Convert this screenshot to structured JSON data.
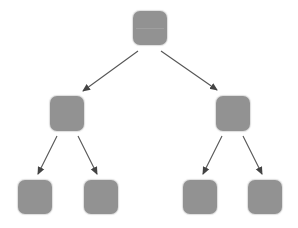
{
  "diagram": {
    "type": "tree",
    "colors": {
      "node_fill": "#929292",
      "edge": "#555555",
      "background": "#ffffff",
      "divider": "#b8b8b8"
    },
    "nodes": [
      {
        "id": "root",
        "level": 0,
        "x": 133,
        "y": 11,
        "w": 34,
        "h": 34,
        "divider": true
      },
      {
        "id": "mid-left",
        "level": 1,
        "x": 50,
        "y": 96,
        "w": 34,
        "h": 35,
        "divider": false
      },
      {
        "id": "mid-right",
        "level": 1,
        "x": 216,
        "y": 96,
        "w": 34,
        "h": 35,
        "divider": false
      },
      {
        "id": "leaf-1",
        "level": 2,
        "x": 18,
        "y": 180,
        "w": 34,
        "h": 34,
        "divider": false
      },
      {
        "id": "leaf-2",
        "level": 2,
        "x": 84,
        "y": 180,
        "w": 34,
        "h": 34,
        "divider": false
      },
      {
        "id": "leaf-3",
        "level": 2,
        "x": 183,
        "y": 180,
        "w": 34,
        "h": 34,
        "divider": false
      },
      {
        "id": "leaf-4",
        "level": 2,
        "x": 248,
        "y": 180,
        "w": 34,
        "h": 34,
        "divider": false
      }
    ],
    "edges": [
      {
        "from": "root",
        "to": "mid-left",
        "x1": 138,
        "y1": 51,
        "x2": 83,
        "y2": 91
      },
      {
        "from": "root",
        "to": "mid-right",
        "x1": 161,
        "y1": 51,
        "x2": 217,
        "y2": 90
      },
      {
        "from": "mid-left",
        "to": "leaf-1",
        "x1": 57,
        "y1": 136,
        "x2": 38,
        "y2": 174
      },
      {
        "from": "mid-left",
        "to": "leaf-2",
        "x1": 78,
        "y1": 136,
        "x2": 97,
        "y2": 174
      },
      {
        "from": "mid-right",
        "to": "leaf-3",
        "x1": 222,
        "y1": 136,
        "x2": 203,
        "y2": 174
      },
      {
        "from": "mid-right",
        "to": "leaf-4",
        "x1": 243,
        "y1": 136,
        "x2": 262,
        "y2": 174
      }
    ]
  }
}
